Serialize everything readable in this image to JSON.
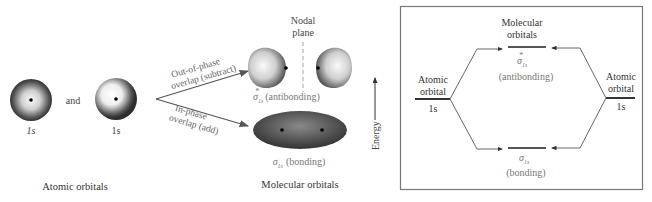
{
  "left_panel": {
    "atomic_orbital_1_label": "1s",
    "connector": "and",
    "atomic_orbital_2_label": "1s",
    "caption": "Atomic orbitals",
    "out_of_phase_line1": "Out-of-phase",
    "out_of_phase_line2": "overlap (subtract)",
    "in_phase_line1": "In-phase",
    "in_phase_line2": "overlap (add)",
    "nodal_line1": "Nodal",
    "nodal_line2": "plane",
    "antibonding_symbol": "σ",
    "antibonding_sub": "1s",
    "antibonding_sup": "*",
    "antibonding_text": "(antibonding)",
    "bonding_symbol": "σ",
    "bonding_sub": "1s",
    "bonding_text": "(bonding)",
    "mo_caption": "Molecular orbitals"
  },
  "energy_axis": {
    "label": "Energy"
  },
  "energy_diagram": {
    "mo_title_line1": "Molecular",
    "mo_title_line2": "orbitals",
    "left_ao_line1": "Atomic",
    "left_ao_line2": "orbital",
    "left_ao_label": "1s",
    "right_ao_line1": "Atomic",
    "right_ao_line2": "orbital",
    "right_ao_label": "1s",
    "antibonding_symbol": "σ",
    "antibonding_sub": "1s",
    "antibonding_sup": "*",
    "antibonding_text": "(antibonding)",
    "bonding_symbol": "σ",
    "bonding_sub": "1s",
    "bonding_text": "(bonding)"
  },
  "colors": {
    "orbital_dark": "#3a3a3a",
    "orbital_light": "#f2f2f2",
    "line": "#555555",
    "text": "#333333",
    "gray_text": "#777777"
  }
}
